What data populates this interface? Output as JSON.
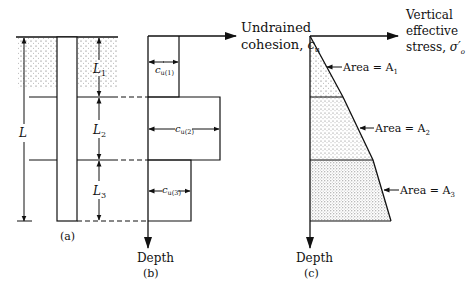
{
  "panel_a": {
    "label": "(a)",
    "L_total": "L",
    "L1": "L",
    "L1_sub": "1",
    "L2": "L",
    "L2_sub": "2",
    "L3": "L",
    "L3_sub": "3"
  },
  "panel_b": {
    "label": "(b)",
    "x_axis": "Undrained",
    "x_axis_line2": "cohesion, ",
    "x_axis_symbol": "c",
    "x_axis_symbol_sub": "u",
    "y_axis": "Depth",
    "cu1": "c",
    "cu1_sub": "u(1)",
    "cu2": "c",
    "cu2_sub": "u(2)",
    "cu3": "c",
    "cu3_sub": "u(3)"
  },
  "panel_c": {
    "label": "(c)",
    "x_axis_line1": "Vertical",
    "x_axis_line2": "effective",
    "x_axis_line3": "stress, ",
    "x_axis_symbol": "σ′",
    "x_axis_symbol_sub": "o",
    "y_axis": "Depth",
    "area1": "Area = A",
    "area1_sub": "1",
    "area2": "Area = A",
    "area2_sub": "2",
    "area3": "Area = A",
    "area3_sub": "3"
  },
  "colors": {
    "line": "#111111",
    "stipple": "#555555",
    "background": "#ffffff"
  }
}
